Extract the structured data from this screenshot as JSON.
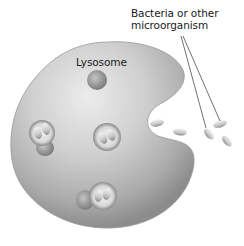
{
  "figure": {
    "labels": {
      "lysosome": "Lysosome",
      "bacteria_line1": "Bacteria or other",
      "bacteria_line2": "microorganism"
    },
    "colors": {
      "background": "#ffffff",
      "cell_light": "#e2e2e2",
      "cell_mid": "#b8b8b8",
      "cell_dark": "#8a8a8a",
      "vesicle_rim": "#7a7a7a",
      "bacterium": "#cfcfcf",
      "leader_line": "#333333",
      "text": "#1a1a1a"
    },
    "elements": {
      "lysosome_count": 1,
      "phagosome_count": 3,
      "free_bacteria_count": 4,
      "leader_lines": 2
    }
  }
}
